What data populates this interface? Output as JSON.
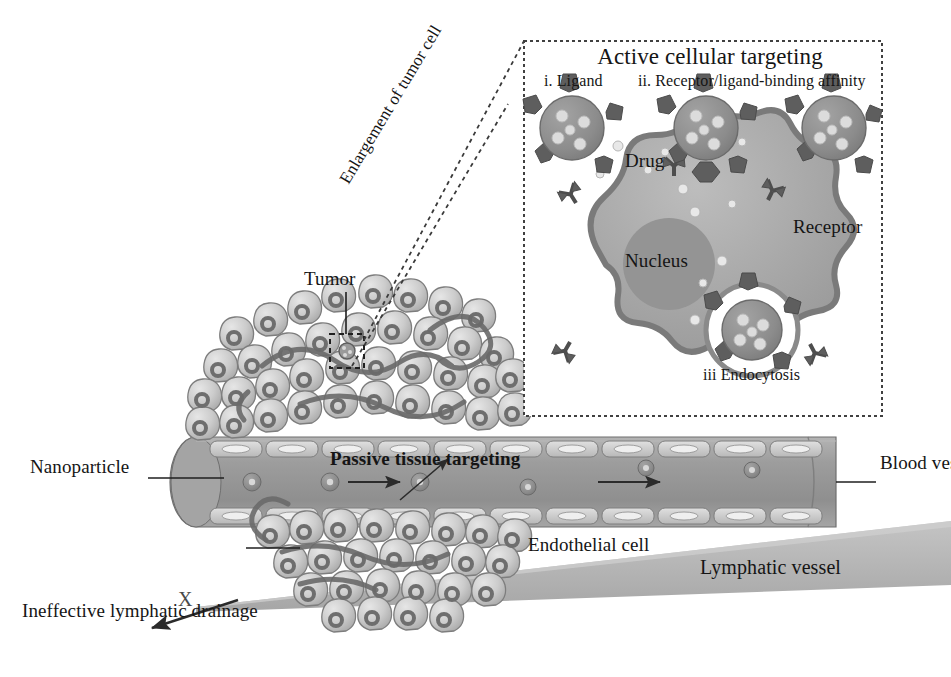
{
  "figure": {
    "kind": "scientific-illustration"
  },
  "inset": {
    "title": "Active cellular targeting",
    "step_ligand": "i. Ligand",
    "step_affinity": "ii. Receptor/ligand-binding affinity",
    "label_drug": "Drug",
    "label_receptor": "Receptor",
    "label_nucleus": "Nucleus",
    "step_endocytosis": "iii Endocytosis",
    "callout": "Enlargement of tumor cell"
  },
  "main": {
    "label_tumor": "Tumor",
    "label_nanoparticle": "Nanoparticle",
    "label_passive": "Passive tissue targeting",
    "label_blood_vessel": "Blood vessel",
    "label_endothelial": "Endothelial cell",
    "label_lymphatic": "Lymphatic vessel",
    "label_ineffective": "Ineffective lymphatic drainage",
    "mark_x": "X"
  },
  "colors": {
    "ink": "#151515",
    "cell_fill": "#c9c9c9",
    "cell_stroke": "#7d7d7d",
    "nucleus_ring": "#6e6e6e",
    "vessel_fill": "#9a9a9a",
    "vessel_stroke": "#6f6f6f",
    "endothelial_fill": "#cfcfcf",
    "lymph_fill": "#b5b5b5",
    "particle_fill": "#8c8c8c",
    "ligand_fill": "#5e5e5e",
    "drug_dot": "#e2e2e2",
    "target_cell_fill": "#a8a8a8",
    "target_cell_stroke": "#7a7a7a",
    "target_nucleus": "#949494",
    "dash_border": "#555555",
    "background": "#ffffff"
  }
}
